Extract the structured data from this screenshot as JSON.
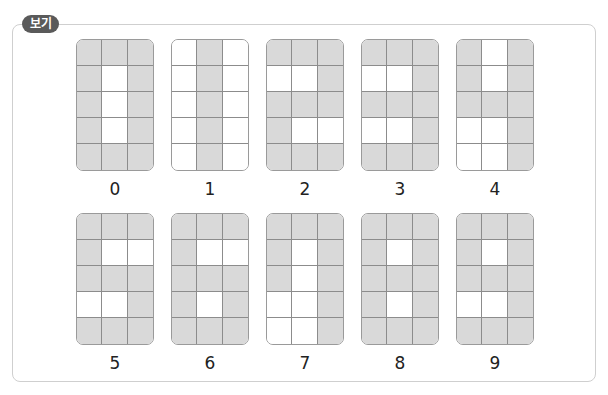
{
  "badge": {
    "label": "보기",
    "color": "#5a5a5a"
  },
  "colors": {
    "filled_cell": "#d9d9d9",
    "empty_cell": "#ffffff",
    "grid_line": "#8c8c8c"
  },
  "grid": {
    "rows": 5,
    "cols": 3
  },
  "digits": [
    {
      "label": "0",
      "pattern": [
        "111",
        "101",
        "101",
        "101",
        "111"
      ]
    },
    {
      "label": "1",
      "pattern": [
        "010",
        "010",
        "010",
        "010",
        "010"
      ]
    },
    {
      "label": "2",
      "pattern": [
        "111",
        "001",
        "111",
        "100",
        "111"
      ]
    },
    {
      "label": "3",
      "pattern": [
        "111",
        "001",
        "111",
        "001",
        "111"
      ]
    },
    {
      "label": "4",
      "pattern": [
        "101",
        "101",
        "111",
        "001",
        "001"
      ]
    },
    {
      "label": "5",
      "pattern": [
        "111",
        "100",
        "111",
        "001",
        "111"
      ]
    },
    {
      "label": "6",
      "pattern": [
        "111",
        "100",
        "111",
        "101",
        "111"
      ]
    },
    {
      "label": "7",
      "pattern": [
        "111",
        "101",
        "101",
        "001",
        "001"
      ]
    },
    {
      "label": "8",
      "pattern": [
        "111",
        "101",
        "111",
        "101",
        "111"
      ]
    },
    {
      "label": "9",
      "pattern": [
        "111",
        "101",
        "111",
        "001",
        "111"
      ]
    }
  ]
}
